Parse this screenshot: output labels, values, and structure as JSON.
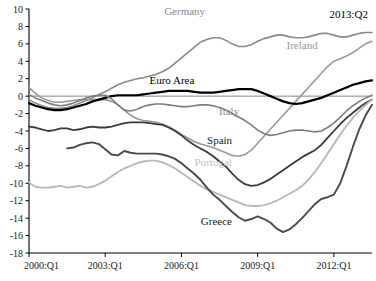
{
  "chart_data": {
    "type": "line",
    "title": "",
    "xlabel": "",
    "ylabel": "",
    "corner_annotation": "2013:Q2",
    "grid": false,
    "legend_position": "inline-labels",
    "ylim": [
      -18,
      10
    ],
    "ytick_labels": [
      "10",
      "8",
      "6",
      "4",
      "2",
      "0",
      "-2",
      "-4",
      "-6",
      "-8",
      "-10",
      "-12",
      "-14",
      "-16",
      "-18"
    ],
    "ytick_values": [
      10,
      8,
      6,
      4,
      2,
      0,
      -2,
      -4,
      -6,
      -8,
      -10,
      -12,
      -14,
      -16,
      -18
    ],
    "xtick_labels": [
      "2000:Q1",
      "2003:Q1",
      "2006:Q1",
      "2009:Q1",
      "2012:Q1"
    ],
    "xtick_values": [
      0,
      12,
      24,
      36,
      48
    ],
    "xlim": [
      0,
      54
    ],
    "series": [
      {
        "name": "Germany",
        "color": "#8a8a8a",
        "width": 1.6,
        "label_x": 24.5,
        "label_y": 9.3,
        "label_color": "#8a8a8a",
        "x": [
          0,
          1,
          2,
          3,
          4,
          5,
          6,
          7,
          8,
          9,
          10,
          11,
          12,
          13,
          14,
          15,
          16,
          17,
          18,
          19,
          20,
          21,
          22,
          23,
          24,
          25,
          26,
          27,
          28,
          29,
          30,
          31,
          32,
          33,
          34,
          35,
          36,
          37,
          38,
          39,
          40,
          41,
          42,
          43,
          44,
          45,
          46,
          47,
          48,
          49,
          50,
          51,
          52,
          53,
          54
        ],
        "values": [
          -0.4,
          -0.8,
          -1.1,
          -1.3,
          -1.4,
          -1.4,
          -1.3,
          -1.1,
          -0.8,
          -0.5,
          -0.2,
          0.2,
          0.5,
          0.9,
          1.3,
          1.6,
          1.8,
          2.0,
          2.1,
          2.3,
          2.5,
          2.8,
          3.2,
          3.8,
          4.4,
          5.0,
          5.6,
          6.2,
          6.5,
          6.7,
          6.7,
          6.4,
          6.0,
          5.7,
          5.7,
          5.9,
          6.3,
          6.6,
          6.8,
          7.0,
          7.0,
          6.8,
          6.7,
          6.7,
          6.8,
          7.0,
          7.2,
          7.2,
          7.0,
          6.8,
          6.8,
          7.0,
          7.2,
          7.3,
          7.3
        ]
      },
      {
        "name": "Ireland",
        "color": "#9a9a9a",
        "width": 1.6,
        "label_x": 43.0,
        "label_y": 5.4,
        "label_color": "#9a9a9a",
        "x": [
          0,
          1,
          2,
          3,
          4,
          5,
          6,
          7,
          8,
          9,
          10,
          11,
          12,
          13,
          14,
          15,
          16,
          17,
          18,
          19,
          20,
          21,
          22,
          23,
          24,
          25,
          26,
          27,
          28,
          29,
          30,
          31,
          32,
          33,
          34,
          35,
          36,
          37,
          38,
          39,
          40,
          41,
          42,
          43,
          44,
          45,
          46,
          47,
          48,
          49,
          50,
          51,
          52,
          53,
          54
        ],
        "values": [
          1.0,
          0.3,
          -0.2,
          -0.5,
          -0.7,
          -0.7,
          -0.6,
          -0.5,
          -0.4,
          -0.4,
          -0.4,
          -0.4,
          -0.4,
          -0.6,
          -1.0,
          -1.6,
          -2.2,
          -2.6,
          -2.8,
          -2.9,
          -3.0,
          -3.2,
          -3.5,
          -3.9,
          -4.4,
          -4.8,
          -5.2,
          -5.5,
          -5.7,
          -5.9,
          -6.2,
          -6.5,
          -6.8,
          -6.9,
          -6.7,
          -6.2,
          -5.4,
          -4.6,
          -3.8,
          -3.0,
          -2.2,
          -1.4,
          -0.6,
          0.2,
          1.0,
          1.8,
          2.6,
          3.4,
          4.0,
          4.3,
          4.6,
          5.0,
          5.5,
          6.0,
          6.3
        ]
      },
      {
        "name": "Euro Area",
        "color": "#000000",
        "width": 2.2,
        "label_x": 22.5,
        "label_y": 1.4,
        "label_color": "#000000",
        "x": [
          0,
          1,
          2,
          3,
          4,
          5,
          6,
          7,
          8,
          9,
          10,
          11,
          12,
          13,
          14,
          15,
          16,
          17,
          18,
          19,
          20,
          21,
          22,
          23,
          24,
          25,
          26,
          27,
          28,
          29,
          30,
          31,
          32,
          33,
          34,
          35,
          36,
          37,
          38,
          39,
          40,
          41,
          42,
          43,
          44,
          45,
          46,
          47,
          48,
          49,
          50,
          51,
          52,
          53,
          54
        ],
        "values": [
          -0.8,
          -1.1,
          -1.3,
          -1.5,
          -1.6,
          -1.6,
          -1.5,
          -1.3,
          -1.1,
          -0.9,
          -0.6,
          -0.4,
          -0.2,
          0.0,
          0.1,
          0.1,
          0.1,
          0.1,
          0.2,
          0.3,
          0.4,
          0.5,
          0.6,
          0.6,
          0.6,
          0.6,
          0.5,
          0.4,
          0.4,
          0.4,
          0.5,
          0.6,
          0.7,
          0.8,
          0.8,
          0.8,
          0.6,
          0.3,
          0.0,
          -0.3,
          -0.6,
          -0.8,
          -0.9,
          -0.8,
          -0.6,
          -0.4,
          -0.2,
          0.1,
          0.4,
          0.7,
          1.0,
          1.3,
          1.5,
          1.7,
          1.8
        ]
      },
      {
        "name": "Italy",
        "color": "#7d7d7d",
        "width": 1.6,
        "label_x": 31.5,
        "label_y": -2.2,
        "label_color": "#8d8d8d",
        "x": [
          0,
          1,
          2,
          3,
          4,
          5,
          6,
          7,
          8,
          9,
          10,
          11,
          12,
          13,
          14,
          15,
          16,
          17,
          18,
          19,
          20,
          21,
          22,
          23,
          24,
          25,
          26,
          27,
          28,
          29,
          30,
          31,
          32,
          33,
          34,
          35,
          36,
          37,
          38,
          39,
          40,
          41,
          42,
          43,
          44,
          45,
          46,
          47,
          48,
          49,
          50,
          51,
          52,
          53,
          54
        ],
        "values": [
          0.2,
          -0.2,
          -0.5,
          -0.8,
          -1.0,
          -1.1,
          -1.0,
          -0.8,
          -0.5,
          -0.2,
          0.0,
          0.1,
          0.1,
          -0.3,
          -1.0,
          -1.6,
          -1.7,
          -1.5,
          -1.2,
          -1.0,
          -0.9,
          -0.9,
          -1.0,
          -1.1,
          -1.2,
          -1.2,
          -1.1,
          -1.0,
          -1.0,
          -1.1,
          -1.3,
          -1.6,
          -2.0,
          -2.4,
          -2.8,
          -3.3,
          -3.9,
          -4.3,
          -4.5,
          -4.4,
          -4.2,
          -4.0,
          -3.9,
          -3.9,
          -4.0,
          -4.1,
          -4.0,
          -3.6,
          -3.1,
          -2.4,
          -1.7,
          -1.1,
          -0.6,
          -0.2,
          0.1
        ]
      },
      {
        "name": "Spain",
        "color": "#3c3c3c",
        "width": 1.8,
        "label_x": 30.0,
        "label_y": -5.5,
        "label_color": "#1a1a1a",
        "x": [
          0,
          1,
          2,
          3,
          4,
          5,
          6,
          7,
          8,
          9,
          10,
          11,
          12,
          13,
          14,
          15,
          16,
          17,
          18,
          19,
          20,
          21,
          22,
          23,
          24,
          25,
          26,
          27,
          28,
          29,
          30,
          31,
          32,
          33,
          34,
          35,
          36,
          37,
          38,
          39,
          40,
          41,
          42,
          43,
          44,
          45,
          46,
          47,
          48,
          49,
          50,
          51,
          52,
          53,
          54
        ],
        "values": [
          -3.5,
          -3.6,
          -3.8,
          -4.0,
          -3.9,
          -3.7,
          -3.7,
          -3.9,
          -3.8,
          -3.6,
          -3.5,
          -3.6,
          -3.6,
          -3.5,
          -3.3,
          -3.1,
          -3.0,
          -3.0,
          -3.0,
          -3.1,
          -3.2,
          -3.3,
          -3.6,
          -4.0,
          -4.5,
          -5.1,
          -5.6,
          -6.0,
          -6.4,
          -6.9,
          -7.5,
          -8.1,
          -8.9,
          -9.6,
          -10.1,
          -10.3,
          -10.2,
          -9.9,
          -9.5,
          -9.0,
          -8.5,
          -8.0,
          -7.5,
          -7.0,
          -6.6,
          -6.2,
          -5.6,
          -4.8,
          -4.0,
          -3.2,
          -2.5,
          -1.9,
          -1.3,
          -0.8,
          -0.4
        ]
      },
      {
        "name": "Portugal",
        "color": "#b9b9b9",
        "width": 1.9,
        "label_x": 29.0,
        "label_y": -8.0,
        "label_color": "#c0c0c0",
        "x": [
          0,
          1,
          2,
          3,
          4,
          5,
          6,
          7,
          8,
          9,
          10,
          11,
          12,
          13,
          14,
          15,
          16,
          17,
          18,
          19,
          20,
          21,
          22,
          23,
          24,
          25,
          26,
          27,
          28,
          29,
          30,
          31,
          32,
          33,
          34,
          35,
          36,
          37,
          38,
          39,
          40,
          41,
          42,
          43,
          44,
          45,
          46,
          47,
          48,
          49,
          50,
          51,
          52,
          53,
          54
        ],
        "values": [
          -9.9,
          -10.4,
          -10.5,
          -10.5,
          -10.4,
          -10.3,
          -10.5,
          -10.4,
          -10.3,
          -10.5,
          -10.4,
          -10.1,
          -9.7,
          -9.2,
          -8.7,
          -8.3,
          -8.0,
          -7.7,
          -7.5,
          -7.4,
          -7.4,
          -7.6,
          -7.9,
          -8.3,
          -8.8,
          -9.3,
          -9.8,
          -10.3,
          -10.7,
          -11.0,
          -11.3,
          -11.6,
          -11.9,
          -12.2,
          -12.5,
          -12.6,
          -12.6,
          -12.5,
          -12.3,
          -12.0,
          -11.6,
          -11.2,
          -10.8,
          -10.3,
          -9.6,
          -8.7,
          -7.7,
          -6.6,
          -5.5,
          -4.4,
          -3.4,
          -2.5,
          -1.7,
          -1.0,
          -0.4
        ]
      },
      {
        "name": "Greece",
        "color": "#4a4a4a",
        "width": 1.9,
        "label_x": 29.5,
        "label_y": -14.8,
        "label_color": "#1a1a1a",
        "x": [
          6,
          7,
          8,
          9,
          10,
          11,
          12,
          13,
          14,
          15,
          16,
          17,
          18,
          19,
          20,
          21,
          22,
          23,
          24,
          25,
          26,
          27,
          28,
          29,
          30,
          31,
          32,
          33,
          34,
          35,
          36,
          37,
          38,
          39,
          40,
          41,
          42,
          43,
          44,
          45,
          46,
          47,
          48,
          49,
          50,
          51,
          52,
          53,
          54
        ],
        "values": [
          -6.0,
          -5.9,
          -5.6,
          -5.4,
          -5.3,
          -5.5,
          -6.1,
          -6.7,
          -6.8,
          -6.3,
          -6.5,
          -6.6,
          -6.6,
          -6.6,
          -6.6,
          -6.7,
          -6.9,
          -7.2,
          -7.7,
          -8.3,
          -8.9,
          -9.6,
          -10.5,
          -11.3,
          -11.9,
          -12.6,
          -13.3,
          -13.9,
          -14.3,
          -14.1,
          -13.8,
          -14.1,
          -14.5,
          -15.2,
          -15.6,
          -15.3,
          -14.7,
          -14.0,
          -13.2,
          -12.4,
          -11.8,
          -11.6,
          -11.3,
          -10.0,
          -8.0,
          -5.8,
          -3.8,
          -2.2,
          -1.0
        ]
      }
    ]
  }
}
